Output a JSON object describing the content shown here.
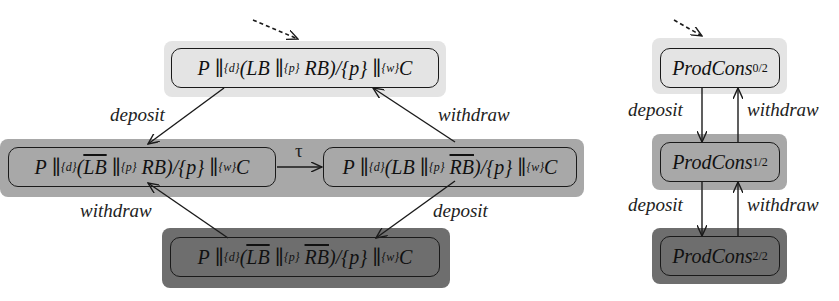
{
  "left_diagram": {
    "states": {
      "top": {
        "P": "P",
        "d": "{d}",
        "LB": "LB",
        "LB_bar": false,
        "p": "{p}",
        "RB": "RB",
        "RB_bar": false,
        "hide": "/{p}",
        "w": "{w}",
        "C": "C",
        "shade": "light"
      },
      "left": {
        "P": "P",
        "d": "{d}",
        "LB": "LB",
        "LB_bar": true,
        "p": "{p}",
        "RB": "RB",
        "RB_bar": false,
        "hide": "/{p}",
        "w": "{w}",
        "C": "C",
        "shade": "mid"
      },
      "right": {
        "P": "P",
        "d": "{d}",
        "LB": "LB",
        "LB_bar": false,
        "p": "{p}",
        "RB": "RB",
        "RB_bar": true,
        "hide": "/{p}",
        "w": "{w}",
        "C": "C",
        "shade": "mid"
      },
      "bottom": {
        "P": "P",
        "d": "{d}",
        "LB": "LB",
        "LB_bar": true,
        "p": "{p}",
        "RB": "RB",
        "RB_bar": true,
        "hide": "/{p}",
        "w": "{w}",
        "C": "C",
        "shade": "dark"
      }
    },
    "edges": {
      "top_left": "deposit",
      "right_top": "withdraw",
      "left_right": "τ",
      "bottom_left": "withdraw",
      "right_bottom": "deposit"
    }
  },
  "right_diagram": {
    "states": [
      {
        "name": "ProdCons",
        "sub": "0/2",
        "shade": "light"
      },
      {
        "name": "ProdCons",
        "sub": "1/2",
        "shade": "mid"
      },
      {
        "name": "ProdCons",
        "sub": "2/2",
        "shade": "dark"
      }
    ],
    "edges": {
      "dep1": "deposit",
      "wd1": "withdraw",
      "dep2": "deposit",
      "wd2": "withdraw"
    }
  },
  "colors": {
    "light": "#e4e4e4",
    "mid": "#a8a8a8",
    "dark": "#6e6e6e",
    "line": "#1a1a1a"
  }
}
